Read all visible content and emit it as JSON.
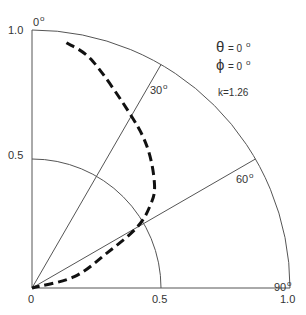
{
  "chart_data": {
    "type": "line",
    "subtype": "polar-quadrant",
    "title": "",
    "angle_reference": "measured from vertical axis (0° at top) toward horizontal (90° at right)",
    "radial_range": [
      0,
      1.0
    ],
    "radial_ticks": [
      "0",
      "0.5",
      "1.0"
    ],
    "angle_ticks": [
      "0°",
      "30°",
      "60°",
      "90°"
    ],
    "grid_arcs": [
      0.5,
      1.0
    ],
    "grid_rays_deg": [
      0,
      30,
      60,
      90
    ],
    "annotations": {
      "theta": "θ = 0°",
      "phi": "ϕ = 0°",
      "k": "k=1.26"
    },
    "series": [
      {
        "name": "pattern",
        "style": "dashed",
        "theta_deg": [
          8,
          15,
          30,
          40,
          50,
          55,
          60,
          65,
          75,
          90
        ],
        "r": [
          0.96,
          0.91,
          0.77,
          0.7,
          0.62,
          0.56,
          0.47,
          0.32,
          0.17,
          0.0
        ]
      }
    ]
  },
  "labels": {
    "y_top": "1.0",
    "y_mid": "0.5",
    "origin": "0",
    "x_mid": "0.5",
    "x_end": "1.0",
    "a0": "0",
    "a30": "30",
    "a60": "60",
    "a90": "90",
    "deg": "o",
    "theta_sym": "θ",
    "theta_val": "= 0",
    "phi_sym": "ϕ",
    "phi_val": "= 0",
    "k": "k=1.26"
  }
}
